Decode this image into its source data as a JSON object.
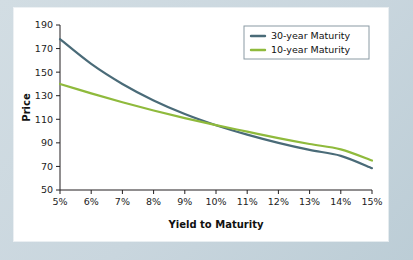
{
  "figure": {
    "panel_background": "#ffffff",
    "outer_background": "#ccd9e0"
  },
  "chart_data": {
    "type": "line",
    "title": "",
    "subtitle": "",
    "xlabel": "Yield to Maturity",
    "ylabel": "Price",
    "xlim": [
      5,
      15
    ],
    "ylim": [
      50,
      190
    ],
    "grid": false,
    "legend_position": "top-right",
    "x": [
      5,
      6,
      7,
      8,
      9,
      10,
      11,
      12,
      13,
      14,
      15
    ],
    "xtick_labels": [
      "5%",
      "6%",
      "7%",
      "8%",
      "9%",
      "10%",
      "11%",
      "12%",
      "13%",
      "14%",
      "15%"
    ],
    "ytick_labels": [
      "50",
      "70",
      "90",
      "110",
      "130",
      "150",
      "170",
      "190"
    ],
    "ytick_values": [
      50,
      70,
      90,
      110,
      130,
      150,
      170,
      190
    ],
    "series": [
      {
        "name": "30-year Maturity",
        "color": "#4a6b78",
        "values": [
          178.0,
          157.0,
          140.0,
          126.0,
          114.5,
          105.0,
          97.0,
          90.0,
          84.0,
          79.0,
          68.5
        ]
      },
      {
        "name": "10-year Maturity",
        "color": "#8fba3c",
        "values": [
          140.0,
          132.0,
          124.5,
          117.5,
          111.0,
          105.0,
          99.5,
          94.0,
          89.0,
          84.5,
          75.0
        ]
      }
    ],
    "annotations": []
  },
  "legend": {
    "entries": [
      {
        "label": "30-year Maturity",
        "color": "#4a6b78"
      },
      {
        "label": "10-year Maturity",
        "color": "#8fba3c"
      }
    ]
  }
}
